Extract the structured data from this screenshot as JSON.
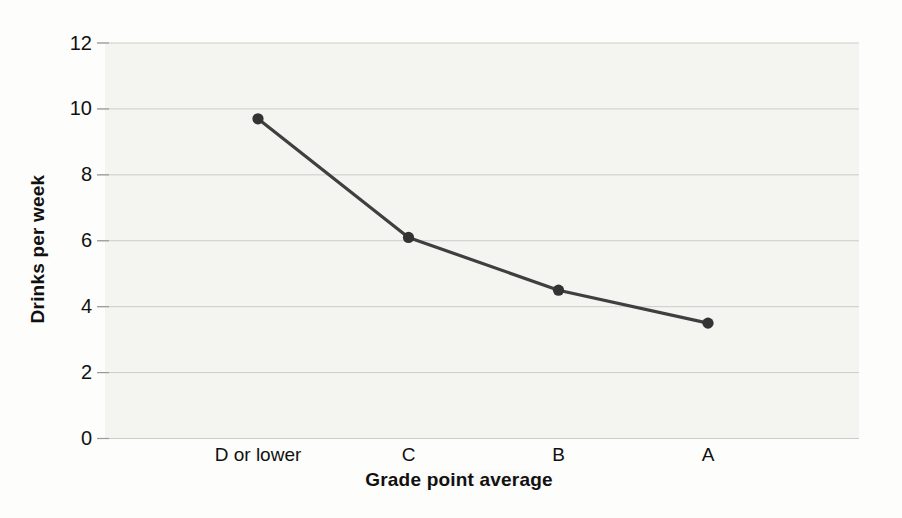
{
  "chart_data": {
    "type": "line",
    "title": "",
    "categories": [
      "D or lower",
      "C",
      "B",
      "A"
    ],
    "series": [
      {
        "name": "Drinks per week",
        "values": [
          9.7,
          6.1,
          4.5,
          3.5
        ]
      }
    ],
    "values": [
      9.7,
      6.1,
      4.5,
      3.5
    ],
    "xlabel": "Grade point average",
    "ylabel": "Drinks per week",
    "ylim": [
      0,
      12
    ],
    "yticks": [
      0,
      2,
      4,
      6,
      8,
      10,
      12
    ],
    "grid": true,
    "legend_position": "none",
    "marker": "filled-circle",
    "colors": {
      "line": "#3f3f3f",
      "marker": "#333333",
      "plot_background": "#f4f4f1",
      "gridline": "#cbcbc9",
      "tick_mark": "#9a9a9a",
      "text": "#111111",
      "page_background": "#fdfdfc"
    }
  }
}
